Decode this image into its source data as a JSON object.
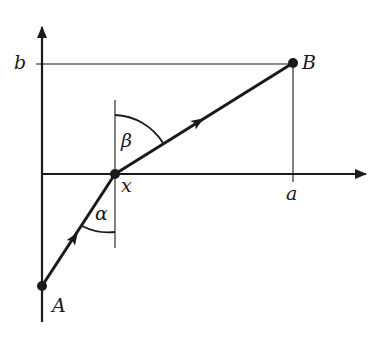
{
  "diagram": {
    "type": "geometric-optics-refraction",
    "points": {
      "A": {
        "label": "A",
        "x": 42,
        "y": 286
      },
      "B": {
        "label": "B",
        "x": 293,
        "y": 63
      },
      "X": {
        "label": "x",
        "x": 115,
        "y": 174
      }
    },
    "axes": {
      "x_tick_label": "a",
      "y_tick_label": "b"
    },
    "angles": {
      "alpha": {
        "label": "α"
      },
      "beta": {
        "label": "β"
      }
    },
    "colors": {
      "ink": "#1a1a1a",
      "background": "#ffffff"
    }
  }
}
